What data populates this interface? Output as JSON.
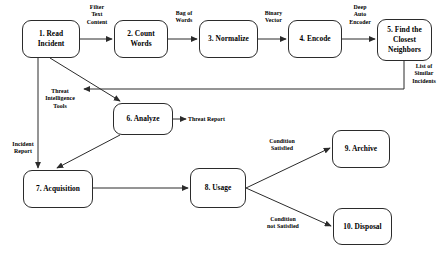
{
  "diagram": {
    "type": "flowchart",
    "background_color": "#ffffff",
    "stroke_color": "#2b2b2b",
    "nodes": [
      {
        "id": "n1",
        "label": "1. Read\nIncident",
        "x": 22,
        "y": 20,
        "w": 58,
        "h": 38
      },
      {
        "id": "n2",
        "label": "2. Count\nWords",
        "x": 114,
        "y": 20,
        "w": 54,
        "h": 38
      },
      {
        "id": "n3",
        "label": "3. Normalize",
        "x": 199,
        "y": 20,
        "w": 59,
        "h": 38
      },
      {
        "id": "n4",
        "label": "4. Encode",
        "x": 288,
        "y": 20,
        "w": 54,
        "h": 38
      },
      {
        "id": "n5",
        "label": "5. Find the\nClosest\nNeighbors",
        "x": 377,
        "y": 19,
        "w": 55,
        "h": 42
      },
      {
        "id": "n6",
        "label": "6. Analyze",
        "x": 113,
        "y": 103,
        "w": 60,
        "h": 32
      },
      {
        "id": "n7",
        "label": "7. Acquisition",
        "x": 23,
        "y": 170,
        "w": 70,
        "h": 38
      },
      {
        "id": "n8",
        "label": "8. Usage",
        "x": 190,
        "y": 168,
        "w": 56,
        "h": 40
      },
      {
        "id": "n9",
        "label": "9. Archive",
        "x": 332,
        "y": 130,
        "w": 58,
        "h": 38
      },
      {
        "id": "n10",
        "label": "10. Disposal",
        "x": 333,
        "y": 208,
        "w": 59,
        "h": 37
      }
    ],
    "edge_labels": [
      {
        "id": "e1",
        "text": "Filter\nText\nContent",
        "x": 82,
        "y": 4,
        "w": 30
      },
      {
        "id": "e2",
        "text": "Bag of\nWords",
        "x": 169,
        "y": 10,
        "w": 30
      },
      {
        "id": "e3",
        "text": "Binary\nVector",
        "x": 259,
        "y": 10,
        "w": 29
      },
      {
        "id": "e4",
        "text": "Deep\nAuto\nEncoder",
        "x": 343,
        "y": 4,
        "w": 34
      },
      {
        "id": "e5",
        "text": "List of\nSimilar\nIncidents",
        "x": 405,
        "y": 63,
        "w": 38
      },
      {
        "id": "e6",
        "text": "Threat\nIntelligence\nTools",
        "x": 36,
        "y": 88,
        "w": 48
      },
      {
        "id": "e7",
        "text": "Threat Report",
        "x": 188,
        "y": 116,
        "w": 52
      },
      {
        "id": "e8",
        "text": "Incident\nReport",
        "x": 8,
        "y": 141,
        "w": 30
      },
      {
        "id": "e9",
        "text": "Condition\nSatisfied",
        "x": 258,
        "y": 138,
        "w": 48
      },
      {
        "id": "e10",
        "text": "Condition\nnot Satisfied",
        "x": 256,
        "y": 216,
        "w": 54
      }
    ],
    "edges": [
      {
        "id": "a1",
        "from": "1. Read Incident",
        "to": "2. Count Words",
        "label": "Filter Text Content"
      },
      {
        "id": "a2",
        "from": "2. Count Words",
        "to": "3. Normalize",
        "label": "Bag of Words"
      },
      {
        "id": "a3",
        "from": "3. Normalize",
        "to": "4. Encode",
        "label": "Binary Vector"
      },
      {
        "id": "a4",
        "from": "4. Encode",
        "to": "5. Find the Closest Neighbors",
        "label": "Deep Auto Encoder"
      },
      {
        "id": "a5",
        "from": "5. Find the Closest Neighbors",
        "to": "6. Analyze",
        "label": "List of Similar Incidents"
      },
      {
        "id": "a6",
        "from": "1. Read Incident",
        "to": "6. Analyze",
        "label": "Threat Intelligence Tools"
      },
      {
        "id": "a7",
        "from": "6. Analyze",
        "to": "Threat Report",
        "label": ""
      },
      {
        "id": "a8",
        "from": "1. Read Incident",
        "to": "7. Acquisition",
        "label": "Incident Report"
      },
      {
        "id": "a9",
        "from": "6. Analyze",
        "to": "7. Acquisition",
        "label": ""
      },
      {
        "id": "a10",
        "from": "7. Acquisition",
        "to": "8. Usage",
        "label": ""
      },
      {
        "id": "a11",
        "from": "8. Usage",
        "to": "9. Archive",
        "label": "Condition Satisfied"
      },
      {
        "id": "a12",
        "from": "8. Usage",
        "to": "10. Disposal",
        "label": "Condition not Satisfied"
      }
    ]
  }
}
